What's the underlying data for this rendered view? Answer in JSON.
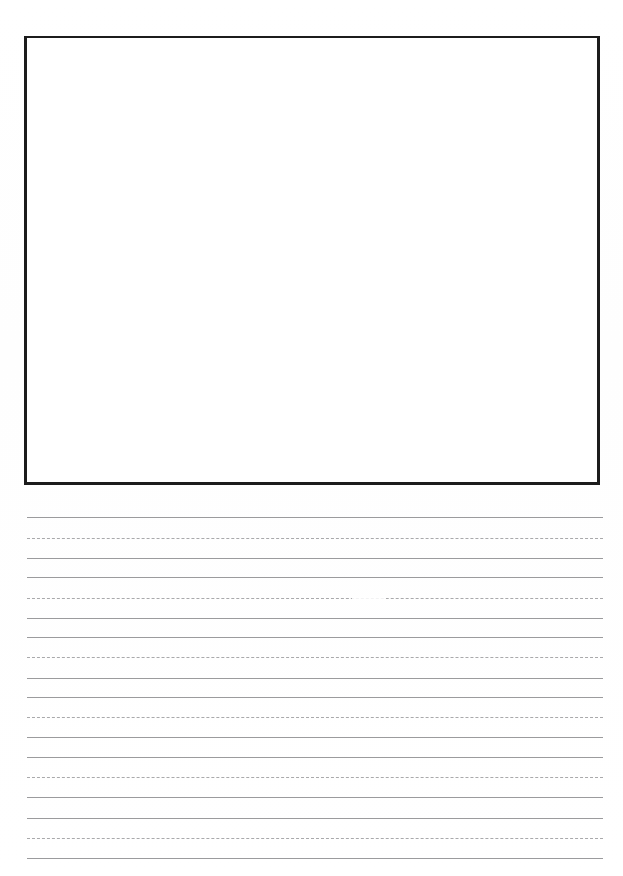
{
  "page": {
    "width": 623,
    "height": 876,
    "background_color": "#ffffff",
    "document_type": "handwriting-practice-worksheet",
    "orientation": "portrait"
  },
  "drawing_box": {
    "name": "illustration-box",
    "x": 24,
    "y": 36,
    "width": 576,
    "height": 449,
    "border_color": "#1c1c1c",
    "border_width": 3,
    "fill_color": "#ffffff",
    "content": ""
  },
  "writing_area": {
    "name": "ruled-writing-area",
    "left": 27,
    "right": 603,
    "line_length": 576,
    "first_line_y": 517,
    "last_line_y": 847,
    "line_spacing": 20.6,
    "line_count": 17,
    "solid_color": "#9b9b9d",
    "dashed_color": "#a9a9ab",
    "group_pattern": [
      "solid",
      "dashed",
      "solid"
    ],
    "lines": [
      {
        "index": 0,
        "y": 517,
        "style": "solid"
      },
      {
        "index": 1,
        "y": 538,
        "style": "dashed"
      },
      {
        "index": 2,
        "y": 558,
        "style": "solid"
      },
      {
        "index": 3,
        "y": 577,
        "style": "solid"
      },
      {
        "index": 4,
        "y": 598,
        "style": "dashed"
      },
      {
        "index": 5,
        "y": 618,
        "style": "solid"
      },
      {
        "index": 6,
        "y": 637,
        "style": "solid"
      },
      {
        "index": 7,
        "y": 657,
        "style": "dashed"
      },
      {
        "index": 8,
        "y": 678,
        "style": "solid"
      },
      {
        "index": 9,
        "y": 697,
        "style": "solid"
      },
      {
        "index": 10,
        "y": 717,
        "style": "dashed"
      },
      {
        "index": 11,
        "y": 737,
        "style": "solid"
      },
      {
        "index": 12,
        "y": 757,
        "style": "solid"
      },
      {
        "index": 13,
        "y": 777,
        "style": "dashed"
      },
      {
        "index": 14,
        "y": 797,
        "style": "solid"
      },
      {
        "index": 15,
        "y": 818,
        "style": "solid"
      },
      {
        "index": 16,
        "y": 838,
        "style": "dashed"
      },
      {
        "index": 17,
        "y": 858,
        "style": "solid"
      }
    ],
    "scan_artifacts": [
      {
        "line_index": 4,
        "x": 352,
        "width": 34,
        "description": "faded-dash-dropout"
      }
    ],
    "written_text": ""
  }
}
